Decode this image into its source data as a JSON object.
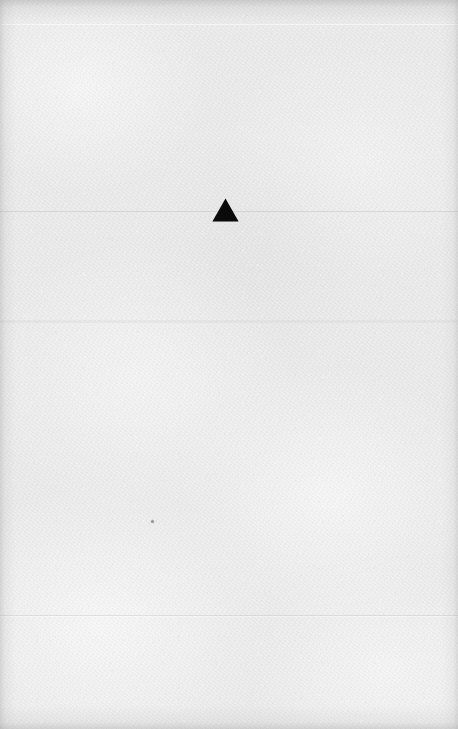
{
  "document": {
    "kind": "scanned-paper-sheet",
    "description": "Textured off-white paper sheet with a single small solid black upward-pointing triangle near the upper middle",
    "width_px": 458,
    "height_px": 729,
    "background_color": "#e9e9e9",
    "text_content": ""
  },
  "marks": {
    "triangle": {
      "glyph": "▲",
      "shape": "upward-pointing-triangle",
      "fill_color": "#0a0a0a",
      "x_px": 212,
      "y_px": 198,
      "width_px": 27,
      "height_px": 24
    },
    "speck": {
      "shape": "dot",
      "fill_color": "#606060",
      "x_px": 151,
      "y_px": 520,
      "size_px": 3
    }
  },
  "texture": {
    "paper_tone": "#e9e9e9",
    "highlight_tone": "#f6f6f6",
    "shadow_tone": "#d6d6d6",
    "vignette_color": "#969696",
    "scan_lines": [
      {
        "y_px": 24,
        "tone": "light"
      },
      {
        "y_px": 211,
        "tone": "dark"
      },
      {
        "y_px": 320,
        "tone": "dark"
      },
      {
        "y_px": 615,
        "tone": "dark"
      }
    ]
  }
}
